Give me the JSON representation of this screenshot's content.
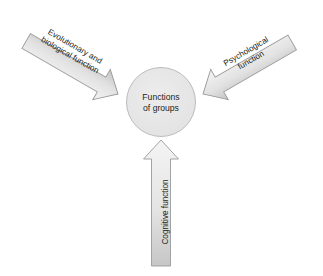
{
  "diagram": {
    "title_center": {
      "line1": "Functions",
      "line2": "of groups"
    },
    "arrows": [
      {
        "id": "evolutionary-biological",
        "line1": "Evolutionary and",
        "line2": "biological function",
        "direction": "down-right",
        "angle_deg": 30
      },
      {
        "id": "psychological",
        "line1": "Psychological",
        "line2": "function",
        "direction": "down-left",
        "angle_deg": -30
      },
      {
        "id": "cognitive",
        "line1": "Cognitive function",
        "line2": "",
        "direction": "up",
        "angle_deg": -90
      }
    ],
    "colors": {
      "background": "#ffffff",
      "arrow_fill_light": "#f2f2f2",
      "arrow_fill_dark": "#c9c9c9",
      "arrow_stroke": "#9a9a9a",
      "circle_fill": "#e8e8e8",
      "circle_stroke": "#b4b4b4",
      "text": "#231f20"
    }
  }
}
